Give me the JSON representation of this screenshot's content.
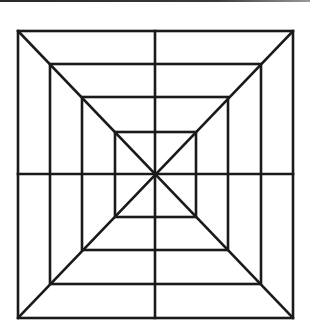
{
  "diagram": {
    "type": "nested-squares-web",
    "stroke_color": "#1a1a1a",
    "background": "#ffffff",
    "center": [
      155,
      174
    ],
    "squares": [
      {
        "name": "outer",
        "x1": 18,
        "y1": 31,
        "x2": 293,
        "y2": 318
      },
      {
        "name": "second",
        "x1": 50,
        "y1": 64,
        "x2": 261,
        "y2": 284
      },
      {
        "name": "third",
        "x1": 82,
        "y1": 97,
        "x2": 228,
        "y2": 250
      },
      {
        "name": "inner",
        "x1": 115,
        "y1": 132,
        "x2": 196,
        "y2": 217
      }
    ],
    "lines": "two diagonals plus vertical and horizontal midlines"
  }
}
